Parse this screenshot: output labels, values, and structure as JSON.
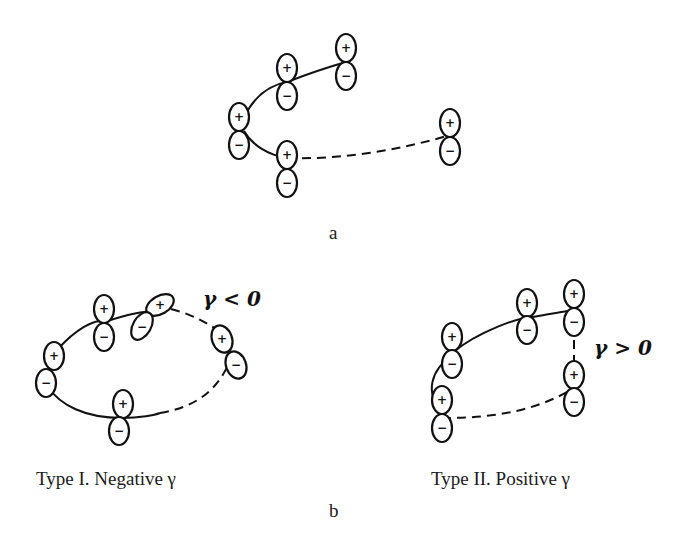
{
  "figure": {
    "panel_a": {
      "label": "a",
      "description": "Open conjugated chain of p-orbitals (lobes + above, - below)"
    },
    "panel_b": {
      "label": "b",
      "type_I": {
        "caption": "Type I. Negative γ",
        "annotation": "γ < 0"
      },
      "type_II": {
        "caption": "Type II. Positive γ",
        "annotation": "γ > 0"
      }
    },
    "orbital_signs": {
      "top": "+",
      "bottom": "−"
    }
  }
}
